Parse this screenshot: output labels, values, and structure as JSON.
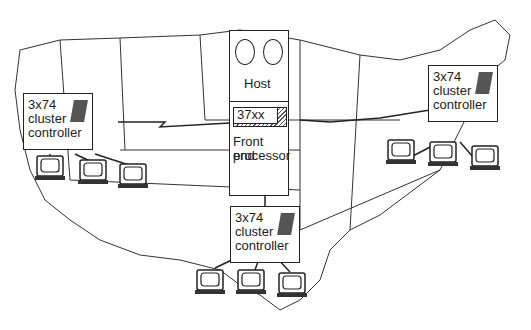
{
  "diagram": {
    "host": {
      "label": "Host"
    },
    "fep": {
      "chip_label": "37xx",
      "label_line1": "Front end",
      "label_line2": "processor"
    },
    "controllers": [
      {
        "id": "west",
        "line1": "3x74",
        "line2": "cluster",
        "line3": "controller"
      },
      {
        "id": "east",
        "line1": "3x74",
        "line2": "cluster",
        "line3": "controller"
      },
      {
        "id": "south",
        "line1": "3x74",
        "line2": "cluster",
        "line3": "controller"
      }
    ],
    "terminals_per_controller": 3,
    "background": "US map outline"
  }
}
